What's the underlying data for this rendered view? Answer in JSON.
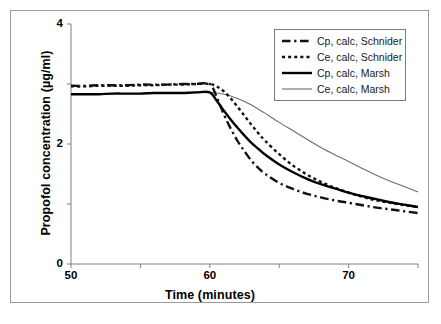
{
  "figure": {
    "background_color": "#ffffff",
    "border_color": "#9a9a9a"
  },
  "chart_data": {
    "type": "line",
    "title": "",
    "xlabel": "Time (minutes)",
    "ylabel": "Propofol concentration (µg/ml)",
    "xlim": [
      50,
      75
    ],
    "ylim": [
      0,
      4
    ],
    "xticks": [
      50,
      60,
      70
    ],
    "xtick_labels": [
      "50",
      "60",
      "70"
    ],
    "xminor_ticks": [
      55,
      65,
      75
    ],
    "yticks": [
      0,
      2,
      4
    ],
    "ytick_labels": [
      "0",
      "2",
      "4"
    ],
    "yminor_ticks": [
      1,
      3
    ],
    "grid": false,
    "legend_position": "top-right",
    "infusion_stop_time": 60,
    "series": [
      {
        "name": "Cp, calc, Schnider",
        "style": "dash-dot",
        "color": "#111111",
        "width": 2.4,
        "x": [
          50,
          51,
          52,
          53,
          54,
          55,
          56,
          57,
          58,
          59,
          60,
          60.5,
          61,
          61.5,
          62,
          62.5,
          63,
          63.5,
          64,
          65,
          66,
          67,
          68,
          69,
          70,
          71,
          72,
          73,
          74,
          75
        ],
        "y": [
          2.97,
          2.97,
          2.98,
          2.98,
          2.98,
          2.99,
          2.99,
          2.99,
          3.0,
          3.0,
          3.0,
          2.78,
          2.5,
          2.26,
          2.05,
          1.88,
          1.72,
          1.6,
          1.5,
          1.35,
          1.25,
          1.17,
          1.11,
          1.06,
          1.02,
          0.98,
          0.94,
          0.91,
          0.88,
          0.85
        ]
      },
      {
        "name": "Ce, calc, Schnider",
        "style": "dotted",
        "color": "#111111",
        "width": 2.4,
        "x": [
          50,
          51,
          52,
          53,
          54,
          55,
          56,
          57,
          58,
          59,
          60,
          60.5,
          61,
          61.5,
          62,
          62.5,
          63,
          63.5,
          64,
          65,
          66,
          67,
          68,
          69,
          70,
          71,
          72,
          73,
          74,
          75
        ],
        "y": [
          2.96,
          2.96,
          2.97,
          2.97,
          2.97,
          2.98,
          2.98,
          2.99,
          2.99,
          3.0,
          3.0,
          2.96,
          2.88,
          2.76,
          2.62,
          2.47,
          2.32,
          2.18,
          2.05,
          1.83,
          1.64,
          1.49,
          1.37,
          1.27,
          1.19,
          1.12,
          1.06,
          1.02,
          0.98,
          0.95
        ]
      },
      {
        "name": "Cp, calc, Marsh",
        "style": "solid",
        "color": "#000000",
        "width": 2.4,
        "x": [
          50,
          51,
          52,
          53,
          54,
          55,
          56,
          57,
          58,
          59,
          60,
          60.5,
          61,
          61.5,
          62,
          62.5,
          63,
          63.5,
          64,
          65,
          66,
          67,
          68,
          69,
          70,
          71,
          72,
          73,
          74,
          75
        ],
        "y": [
          2.83,
          2.83,
          2.83,
          2.84,
          2.84,
          2.84,
          2.85,
          2.85,
          2.85,
          2.86,
          2.86,
          2.72,
          2.56,
          2.41,
          2.27,
          2.14,
          2.02,
          1.92,
          1.82,
          1.66,
          1.53,
          1.42,
          1.33,
          1.26,
          1.19,
          1.13,
          1.08,
          1.03,
          0.99,
          0.95
        ]
      },
      {
        "name": "Ce, calc, Marsh",
        "style": "solid-thin",
        "color": "#6e6e6e",
        "width": 1.1,
        "x": [
          50,
          51,
          52,
          53,
          54,
          55,
          56,
          57,
          58,
          59,
          60,
          60.5,
          61,
          61.5,
          62,
          62.5,
          63,
          63.5,
          64,
          65,
          66,
          67,
          68,
          69,
          70,
          71,
          72,
          73,
          74,
          75
        ],
        "y": [
          2.83,
          2.83,
          2.83,
          2.84,
          2.84,
          2.84,
          2.85,
          2.85,
          2.85,
          2.86,
          2.86,
          2.85,
          2.83,
          2.8,
          2.76,
          2.71,
          2.65,
          2.58,
          2.51,
          2.36,
          2.22,
          2.08,
          1.94,
          1.82,
          1.71,
          1.59,
          1.48,
          1.38,
          1.29,
          1.2
        ]
      }
    ],
    "legend": [
      {
        "label": "Cp, calc, Schnider",
        "style": "dash-dot",
        "color": "#111111",
        "width": 2.4
      },
      {
        "label": "Ce, calc, Schnider",
        "style": "dotted",
        "color": "#111111",
        "width": 2.4
      },
      {
        "label": "Cp, calc, Marsh",
        "style": "solid",
        "color": "#000000",
        "width": 2.4
      },
      {
        "label": "Ce, calc, Marsh",
        "style": "solid-thin",
        "color": "#6e6e6e",
        "width": 1.1
      }
    ]
  }
}
